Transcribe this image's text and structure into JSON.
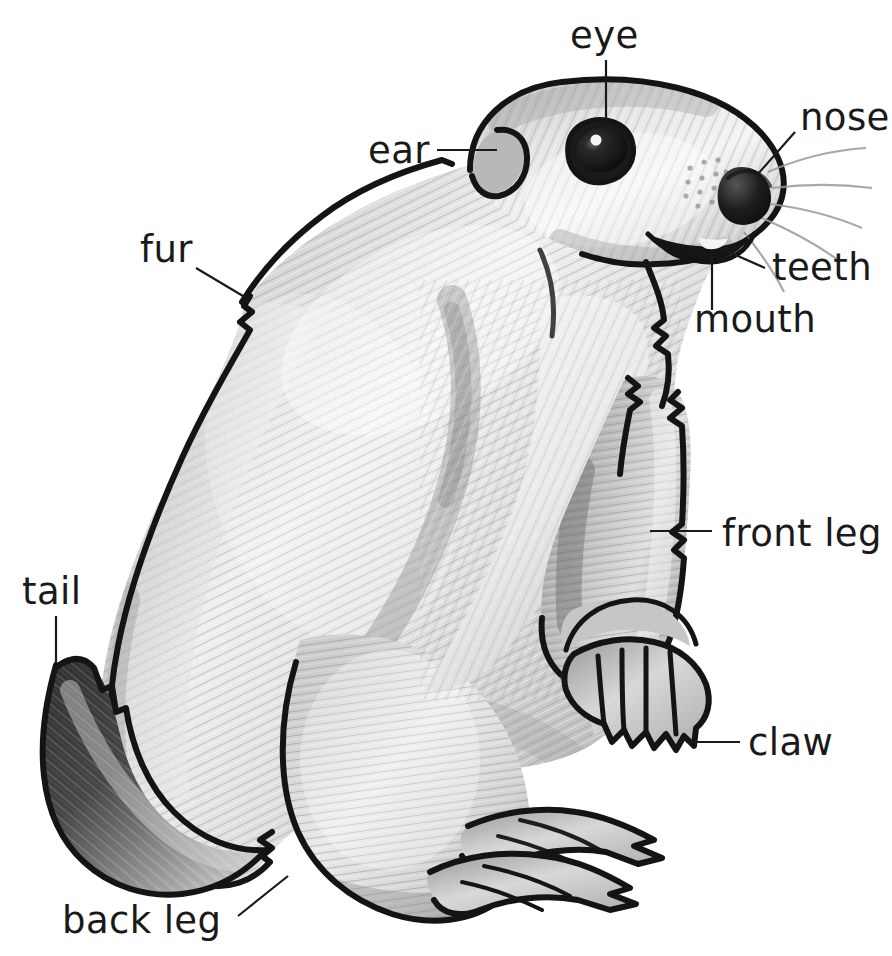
{
  "figure": {
    "kind": "labeled anatomy illustration",
    "background_color": "#ffffff",
    "ink_color": "#1a1a1a",
    "label_font_size_px": 37
  },
  "labels": [
    {
      "id": "eye",
      "text": "eye",
      "text_x": 570,
      "text_y": 48,
      "anchor": "start",
      "leader": "M 606,60 L 606,130",
      "target_part": "eye"
    },
    {
      "id": "nose",
      "text": "nose",
      "text_x": 800,
      "text_y": 130,
      "anchor": "start",
      "leader": "M 795,132 L 757,175",
      "target_part": "nose"
    },
    {
      "id": "ear",
      "text": "ear",
      "text_x": 368,
      "text_y": 163,
      "anchor": "start",
      "leader": "M 437,150 L 497,150",
      "target_part": "ear"
    },
    {
      "id": "teeth",
      "text": "teeth",
      "text_x": 772,
      "text_y": 280,
      "anchor": "start",
      "leader": "M 765,268 L 722,249",
      "target_part": "teeth"
    },
    {
      "id": "mouth",
      "text": "mouth",
      "text_x": 694,
      "text_y": 332,
      "anchor": "start",
      "leader": "M 712,310 L 712,252",
      "target_part": "mouth"
    },
    {
      "id": "fur",
      "text": "fur",
      "text_x": 140,
      "text_y": 262,
      "anchor": "start",
      "leader": "M 196,268 L 243,296",
      "target_part": "fur"
    },
    {
      "id": "front-leg",
      "text": "front leg",
      "text_x": 722,
      "text_y": 546,
      "anchor": "start",
      "leader": "M 712,531 L 650,531",
      "target_part": "front leg"
    },
    {
      "id": "tail",
      "text": "tail",
      "text_x": 22,
      "text_y": 604,
      "anchor": "start",
      "leader": "M 56,616 L 56,663",
      "target_part": "tail"
    },
    {
      "id": "claw",
      "text": "claw",
      "text_x": 748,
      "text_y": 755,
      "anchor": "start",
      "leader": "M 740,742 L 686,742",
      "target_part": "claw"
    },
    {
      "id": "back-leg",
      "text": "back leg",
      "text_x": 62,
      "text_y": 933,
      "anchor": "start",
      "leader": "M 238,916 L 288,876",
      "target_part": "back leg"
    }
  ],
  "palette": {
    "outline": "#141414",
    "fur_light": "#f2f2f2",
    "fur_mid": "#c9c9c9",
    "fur_shadow": "#9a9a9a",
    "fur_dark": "#6f6f6f",
    "tail_dark": "#3a3a3a",
    "eye_black": "#111111",
    "white": "#ffffff"
  }
}
